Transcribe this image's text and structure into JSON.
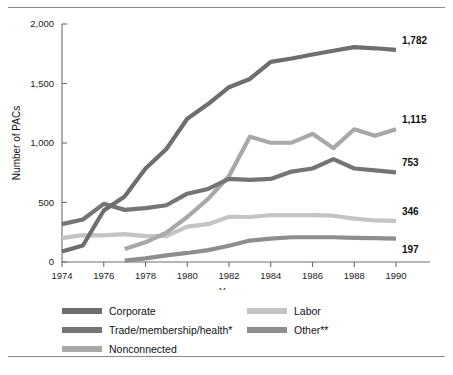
{
  "chart_data": {
    "type": "line",
    "title": "",
    "xlabel": "Year",
    "ylabel": "Number of PACs",
    "xlim": [
      1974,
      1990
    ],
    "ylim": [
      0,
      2000
    ],
    "grid": false,
    "legend_position": "below",
    "x": [
      1974,
      1975,
      1976,
      1977,
      1978,
      1979,
      1980,
      1981,
      1982,
      1983,
      1984,
      1985,
      1986,
      1987,
      1988,
      1989,
      1990
    ],
    "ytick_labels": [
      "0",
      "500",
      "1,000",
      "1,500",
      "2,000"
    ],
    "yticks": [
      0,
      500,
      1000,
      1500,
      2000
    ],
    "xtick_labels": [
      "1974",
      "1976",
      "1978",
      "1980",
      "1982",
      "1984",
      "1986",
      "1988",
      "1990"
    ],
    "xticks": [
      1974,
      1976,
      1978,
      1980,
      1982,
      1984,
      1986,
      1988,
      1990
    ],
    "series": [
      {
        "name": "Corporate",
        "color": "#6e6e6e",
        "end_label": "1,782",
        "x": [
          1974,
          1975,
          1976,
          1977,
          1978,
          1979,
          1980,
          1981,
          1982,
          1983,
          1984,
          1985,
          1986,
          1987,
          1988,
          1989,
          1990
        ],
        "values": [
          89,
          139,
          433,
          550,
          785,
          950,
          1204,
          1327,
          1469,
          1538,
          1682,
          1710,
          1744,
          1775,
          1806,
          1796,
          1782
        ]
      },
      {
        "name": "Trade/membership/health*",
        "color": "#757575",
        "end_label": "753",
        "x": [
          1974,
          1975,
          1976,
          1977,
          1978,
          1979,
          1980,
          1981,
          1982,
          1983,
          1984,
          1985,
          1986,
          1987,
          1988,
          1989,
          1990
        ],
        "values": [
          318,
          357,
          489,
          438,
          453,
          477,
          574,
          614,
          698,
          690,
          698,
          760,
          786,
          865,
          786,
          770,
          753
        ]
      },
      {
        "name": "Nonconnected",
        "color": "#a8a8a8",
        "end_label": "1,115",
        "x": [
          1977,
          1978,
          1979,
          1980,
          1981,
          1982,
          1983,
          1984,
          1985,
          1986,
          1987,
          1988,
          1989,
          1990
        ],
        "values": [
          110,
          165,
          247,
          378,
          531,
          723,
          1053,
          1002,
          1003,
          1077,
          957,
          1115,
          1060,
          1115
        ]
      },
      {
        "name": "Labor",
        "color": "#c4c4c4",
        "end_label": "346",
        "x": [
          1974,
          1975,
          1976,
          1977,
          1978,
          1979,
          1980,
          1981,
          1982,
          1983,
          1984,
          1985,
          1986,
          1987,
          1988,
          1989,
          1990
        ],
        "values": [
          201,
          226,
          224,
          234,
          217,
          217,
          297,
          318,
          380,
          378,
          394,
          394,
          394,
          389,
          364,
          349,
          346
        ]
      },
      {
        "name": "Other**",
        "color": "#8e8e8e",
        "end_label": "197",
        "x": [
          1977,
          1978,
          1979,
          1980,
          1981,
          1982,
          1983,
          1984,
          1985,
          1986,
          1987,
          1988,
          1989,
          1990
        ],
        "values": [
          12,
          30,
          56,
          76,
          100,
          137,
          180,
          196,
          208,
          208,
          208,
          203,
          200,
          197
        ]
      }
    ]
  },
  "legend": {
    "left": [
      {
        "label": "Corporate",
        "color": "#6e6e6e",
        "name": "corporate"
      },
      {
        "label": "Trade/membership/health*",
        "color": "#757575",
        "name": "trade-membership-health"
      },
      {
        "label": "Nonconnected",
        "color": "#a8a8a8",
        "name": "nonconnected"
      }
    ],
    "right": [
      {
        "label": "Labor",
        "color": "#c4c4c4",
        "name": "labor"
      },
      {
        "label": "Other**",
        "color": "#8e8e8e",
        "name": "other"
      }
    ]
  }
}
